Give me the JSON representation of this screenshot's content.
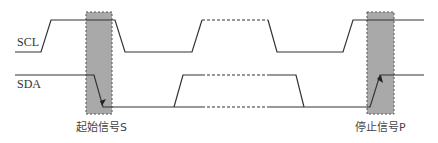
{
  "diagram": {
    "signals": [
      {
        "name": "SCL"
      },
      {
        "name": "SDA"
      }
    ],
    "markers": [
      {
        "label": "起始信号S",
        "meaning": "start condition"
      },
      {
        "label": "停止信号P",
        "meaning": "stop condition"
      }
    ],
    "colors": {
      "line": "#333333",
      "highlight_box": "#a9a9a9",
      "highlight_border": "#555555",
      "background": "#ffffff"
    }
  }
}
